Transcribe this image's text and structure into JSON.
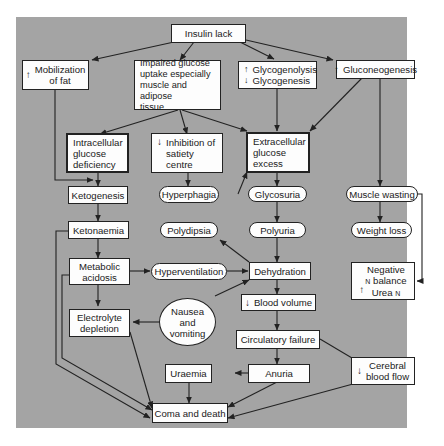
{
  "diagram": {
    "background_color": "#a4a4a4",
    "node_fill": "#fdfdfd",
    "line_color": "#222222",
    "nodes": {
      "insulin_lack": {
        "label": "Insulin lack"
      },
      "mobilization_fat": {
        "prefix": "↑",
        "line1": "Mobilization",
        "line2": "of fat"
      },
      "impaired_glucose": {
        "line1": "Impaired glucose",
        "line2": "uptake especially",
        "line3": "muscle and adipose",
        "line4": "tissue"
      },
      "glycogenolysis": {
        "prefix1": "↑",
        "line1": "Glycogenolysis",
        "prefix2": "↓",
        "line2": "Glycogenesis"
      },
      "gluconeogenesis": {
        "prefix": "↑",
        "label": "Gluconeogenesis"
      },
      "intracellular_deficiency": {
        "line1": "Intracellular",
        "line2": "glucose",
        "line3": "deficiency"
      },
      "inhibition_satiety": {
        "prefix": "↓",
        "line1": "Inhibition of",
        "line2": "satiety",
        "line3": "centre"
      },
      "extracellular_excess": {
        "line1": "Extracellular",
        "line2": "glucose",
        "line3": "excess"
      },
      "ketogenesis": {
        "label": "Ketogenesis"
      },
      "hyperphagia": {
        "label": "Hyperphagia"
      },
      "glycosuria": {
        "label": "Glycosuria"
      },
      "muscle_wasting": {
        "label": "Muscle wasting"
      },
      "ketonaemia": {
        "label": "Ketonaemia"
      },
      "polydipsia": {
        "label": "Polydipsia"
      },
      "polyuria": {
        "label": "Polyuria"
      },
      "weight_loss": {
        "label": "Weight loss"
      },
      "metabolic_acidosis": {
        "line1": "Metabolic",
        "line2": "acidosis"
      },
      "hyperventilation": {
        "label": "Hyperventilation"
      },
      "dehydration": {
        "label": "Dehydration"
      },
      "negative_balance": {
        "line1": "Negative",
        "line2_sub": "N",
        "line2": "balance",
        "prefix": "↑",
        "line3": "Urea",
        "line3_sub": "N"
      },
      "nausea_vomiting": {
        "line1": "Nausea",
        "line2": "and",
        "line3": "vomiting"
      },
      "blood_volume": {
        "prefix": "↓",
        "label": "Blood volume"
      },
      "electrolyte_depletion": {
        "line1": "Electrolyte",
        "line2": "depletion"
      },
      "circulatory_failure": {
        "label": "Circulatory failure"
      },
      "uraemia": {
        "label": "Uraemia"
      },
      "anuria": {
        "label": "Anuria"
      },
      "cerebral_blood_flow": {
        "prefix": "↓",
        "line1": "Cerebral",
        "line2": "blood flow"
      },
      "coma_death": {
        "label": "Coma and death"
      }
    },
    "edges": [
      [
        "Insulin lack",
        "Mobilization of fat"
      ],
      [
        "Insulin lack",
        "Impaired glucose uptake"
      ],
      [
        "Insulin lack",
        "Glycogenolysis/Glycogenesis"
      ],
      [
        "Insulin lack",
        "Gluconeogenesis"
      ],
      [
        "Impaired glucose uptake",
        "Intracellular glucose deficiency"
      ],
      [
        "Impaired glucose uptake",
        "Inhibition of satiety centre"
      ],
      [
        "Impaired glucose uptake",
        "Extracellular glucose excess"
      ],
      [
        "Glycogenolysis/Glycogenesis",
        "Extracellular glucose excess"
      ],
      [
        "Gluconeogenesis",
        "Extracellular glucose excess"
      ],
      [
        "Gluconeogenesis",
        "Muscle wasting"
      ],
      [
        "Mobilization of fat",
        "Ketogenesis"
      ],
      [
        "Intracellular glucose deficiency",
        "Ketogenesis"
      ],
      [
        "Inhibition of satiety centre",
        "Hyperphagia"
      ],
      [
        "Hyperphagia",
        "Extracellular glucose excess"
      ],
      [
        "Extracellular glucose excess",
        "Glycosuria"
      ],
      [
        "Glycosuria",
        "Polyuria"
      ],
      [
        "Polyuria",
        "Dehydration"
      ],
      [
        "Muscle wasting",
        "Weight loss"
      ],
      [
        "Muscle wasting",
        "Negative N balance"
      ],
      [
        "Ketogenesis",
        "Ketonaemia"
      ],
      [
        "Ketonaemia",
        "Metabolic acidosis"
      ],
      [
        "Ketonaemia",
        "Coma and death"
      ],
      [
        "Metabolic acidosis",
        "Hyperventilation"
      ],
      [
        "Metabolic acidosis",
        "Electrolyte depletion"
      ],
      [
        "Metabolic acidosis",
        "Coma and death"
      ],
      [
        "Hyperventilation",
        "Dehydration"
      ],
      [
        "Dehydration",
        "Polydipsia"
      ],
      [
        "Dehydration",
        "Blood volume"
      ],
      [
        "Nausea and vomiting",
        "Dehydration"
      ],
      [
        "Nausea and vomiting",
        "Electrolyte depletion"
      ],
      [
        "Electrolyte depletion",
        "Coma and death"
      ],
      [
        "Blood volume",
        "Circulatory failure"
      ],
      [
        "Circulatory failure",
        "Anuria"
      ],
      [
        "Circulatory failure",
        "Cerebral blood flow"
      ],
      [
        "Anuria",
        "Uraemia"
      ],
      [
        "Anuria",
        "Coma and death"
      ],
      [
        "Uraemia",
        "Coma and death"
      ],
      [
        "Cerebral blood flow",
        "Coma and death"
      ]
    ]
  }
}
